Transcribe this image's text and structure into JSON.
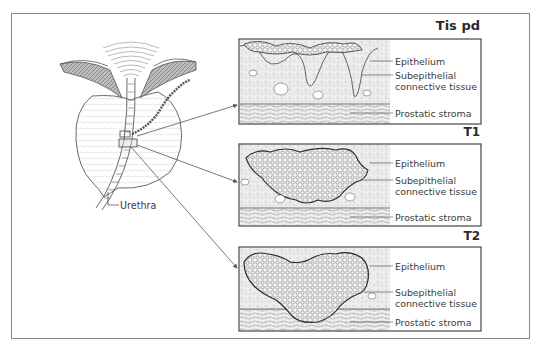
{
  "figure": {
    "type": "anatomical-staging-diagram",
    "left_drawing": {
      "label": "Urethra"
    },
    "panels": [
      {
        "stage": "Tis pd",
        "labels": [
          "Epithelium",
          "Subepithelial",
          "connective tissue",
          "Prostatic stroma"
        ]
      },
      {
        "stage": "T1",
        "labels": [
          "Epithelium",
          "Subepithelial",
          "connective tissue",
          "Prostatic stroma"
        ]
      },
      {
        "stage": "T2",
        "labels": [
          "Epithelium",
          "Subepithelial",
          "connective tissue",
          "Prostatic stroma"
        ]
      }
    ]
  }
}
